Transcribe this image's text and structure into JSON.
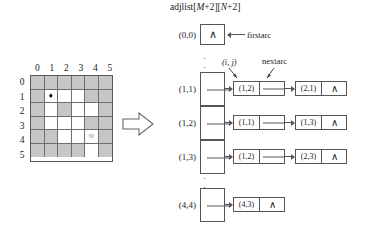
{
  "figure": {
    "caption": ""
  },
  "grid": {
    "name": "maze-grid",
    "col_headers": [
      "0",
      "1",
      "2",
      "3",
      "4",
      "5"
    ],
    "row_headers": [
      "0",
      "1",
      "2",
      "3",
      "4",
      "5"
    ],
    "wall_color": "#c6c6c6",
    "open_color": "#ffffff",
    "start_marker": "♦",
    "end_marker": "☺",
    "cells": [
      [
        "wall",
        "wall",
        "wall",
        "wall",
        "wall",
        "wall"
      ],
      [
        "wall",
        "open",
        "open",
        "open",
        "wall",
        "wall"
      ],
      [
        "wall",
        "open",
        "wall",
        "open",
        "open",
        "wall"
      ],
      [
        "wall",
        "open",
        "open",
        "open",
        "wall",
        "wall"
      ],
      [
        "wall",
        "wall",
        "open",
        "open",
        "open",
        "wall"
      ],
      [
        "wall",
        "wall",
        "wall",
        "wall",
        "open",
        "wall"
      ]
    ],
    "start_cell": {
      "row": 1,
      "col": 1
    },
    "end_cell": {
      "row": 4,
      "col": 4
    }
  },
  "adjlist": {
    "title_prefix": "adjlist[",
    "title": "adjlist[M+2][N+2]",
    "title_parts": {
      "a": "adjlist[",
      "m": "M",
      "b": "+2][",
      "n": "N",
      "c": "+2]"
    },
    "nil_symbol": "∧",
    "annotations": {
      "firstarc": "firstarc",
      "ij": "(i, j)",
      "nextarc": "nextarc"
    },
    "dots": "⋮",
    "rows": [
      {
        "label": "(0,0)",
        "nodes": [],
        "terminator": "∧"
      },
      {
        "label": "(1,1)",
        "nodes": [
          "(1,2)",
          "(2,1)"
        ],
        "terminator": "∧"
      },
      {
        "label": "(1,2)",
        "nodes": [
          "(1,1)",
          "(1,3)"
        ],
        "terminator": "∧"
      },
      {
        "label": "(1,3)",
        "nodes": [
          "(1,2)",
          "(2,3)"
        ],
        "terminator": "∧"
      },
      {
        "label": "(4,4)",
        "nodes": [
          "(4,3)"
        ],
        "terminator": "∧"
      }
    ]
  }
}
